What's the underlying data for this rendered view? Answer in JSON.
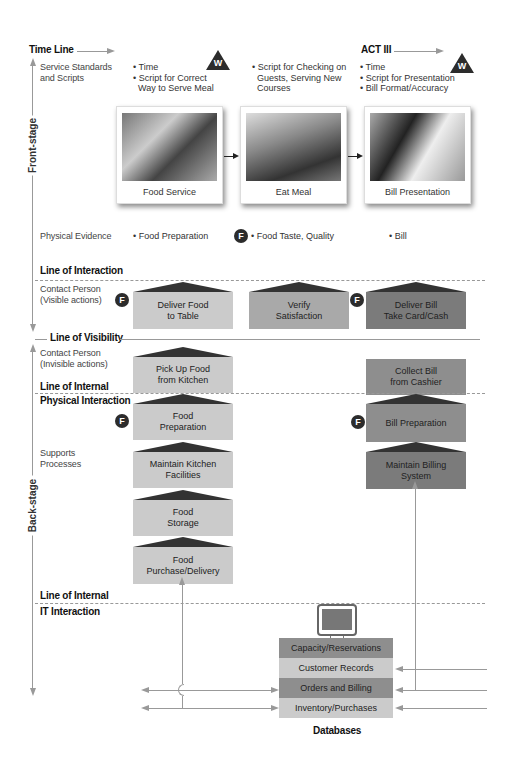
{
  "timeline": {
    "label": "Time Line",
    "act_label": "ACT III"
  },
  "stages": {
    "front": "Front-stage",
    "back": "Back-stage"
  },
  "rows": {
    "service_standards": "Service Standards\nand Scripts",
    "service_standards_l1": "Service Standards",
    "service_standards_l2": "and Scripts",
    "physical_evidence": "Physical Evidence",
    "line_of_interaction": "Line of Interaction",
    "contact_visible_l1": "Contact Person",
    "contact_visible_l2": "(Visible actions)",
    "line_of_visibility": "Line of Visibility",
    "contact_invisible_l1": "Contact Person",
    "contact_invisible_l2": "(Invisible actions)",
    "line_of_internal_1": "Line of Internal",
    "physical_interaction": "Physical Interaction",
    "supports_l1": "Supports",
    "supports_l2": "Processes",
    "line_of_internal_2": "Line of Internal",
    "it_interaction": "IT Interaction"
  },
  "scripts": {
    "col1": [
      "Time",
      "Script for Correct",
      "Way to Serve Meal"
    ],
    "col2": [
      "Script for Checking on",
      "Guests, Serving New",
      "Courses"
    ],
    "col3": [
      "Time",
      "Script for Presentation",
      "Bill Format/Accuracy"
    ]
  },
  "icons": {
    "wait_point": "W",
    "fail_point": "F"
  },
  "photos": [
    {
      "caption": "Food Service"
    },
    {
      "caption": "Eat Meal"
    },
    {
      "caption": "Bill Presentation"
    }
  ],
  "evidence": {
    "col1": "Food Preparation",
    "col2": "Food Taste, Quality",
    "col3": "Bill"
  },
  "visible_actions": [
    {
      "l1": "Deliver Food",
      "l2": "to Table"
    },
    {
      "l1": "Verify",
      "l2": "Satisfaction"
    },
    {
      "l1": "Deliver Bill",
      "l2": "Take Card/Cash"
    }
  ],
  "invisible_actions": [
    {
      "l1": "Pick Up Food",
      "l2": "from Kitchen"
    },
    {
      "l1": "Collect Bill",
      "l2": "from Cashier"
    }
  ],
  "support_left": [
    {
      "l1": "Food",
      "l2": "Preparation"
    },
    {
      "l1": "Maintain Kitchen",
      "l2": "Facilities"
    },
    {
      "l1": "Food",
      "l2": "Storage"
    },
    {
      "l1": "Food",
      "l2": "Purchase/Delivery"
    }
  ],
  "support_right": [
    {
      "l1": "Bill Preparation",
      "l2": ""
    },
    {
      "l1": "Maintain Billing",
      "l2": "System"
    }
  ],
  "databases": {
    "title": "Databases",
    "items": [
      "Capacity/Reservations",
      "Customer Records",
      "Orders and Billing",
      "Inventory/Purchases"
    ]
  }
}
